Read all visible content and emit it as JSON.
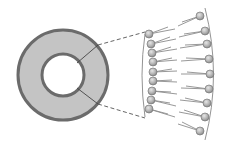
{
  "diagram": {
    "title": "",
    "colors": {
      "background": "#ffffff",
      "ring_fill": "#c4c4c4",
      "ring_stroke": "#6b6b6b",
      "head_fill": "#b8b8b8",
      "head_stroke": "#7a7a7a",
      "tail_stroke": "#8a8a8a",
      "connector": "#555555"
    },
    "liposome": {
      "center": [
        63,
        75
      ],
      "outer_radius": 45,
      "inner_radius": 21
    },
    "bilayer": {
      "inner_leaflet_heads": 9,
      "outer_leaflet_heads": 9
    }
  }
}
